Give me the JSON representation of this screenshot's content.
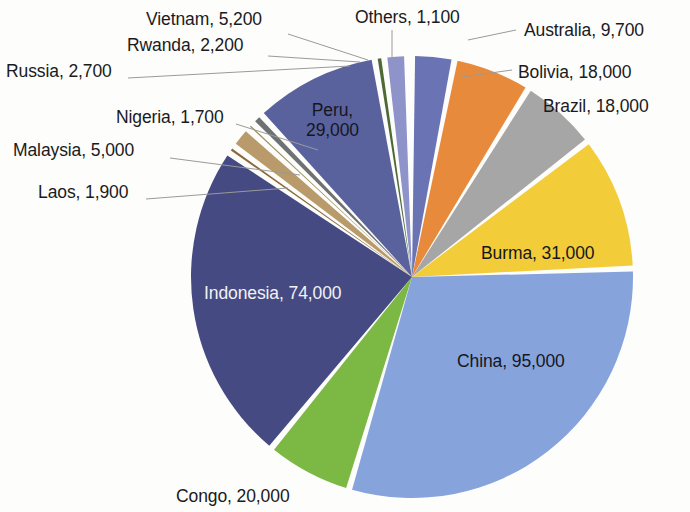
{
  "ghost_artifact": "scan-bleed",
  "chart_data": {
    "type": "pie",
    "title": "",
    "subtitle": "",
    "xlabel": "",
    "ylabel": "",
    "legend_position": "none",
    "grid": false,
    "label_format": "{name}, {value}",
    "total": 308500,
    "explode_gap_degrees": 1.6,
    "start_angle_degrees": 0,
    "direction": "clockwise",
    "categories": [
      "Australia",
      "Bolivia",
      "Brazil",
      "Burma",
      "China",
      "Congo",
      "Indonesia",
      "Laos",
      "Malaysia",
      "Nigeria",
      "Russia",
      "Rwanda",
      "Vietnam",
      "Others"
    ],
    "values": [
      9700,
      18000,
      18000,
      31000,
      95000,
      20000,
      74000,
      1900,
      5000,
      1700,
      2700,
      2200,
      5200,
      1100
    ],
    "colors": [
      "#6a73b4",
      "#e88a3c",
      "#a6a6a6",
      "#f2cc39",
      "#86a3db",
      "#7cb944",
      "#464a82",
      "#8a6a3c",
      "#b99a6a",
      "#9a8c5a",
      "#6e7272",
      "#4c6b33",
      "#8e93c9",
      "#e38b3e"
    ],
    "slices": [
      {
        "name": "Australia",
        "value": 9700,
        "label": "Australia, 9,700",
        "color": "#6a73b4",
        "label_placement": "outside-leader"
      },
      {
        "name": "Bolivia",
        "value": 18000,
        "label": "Bolivia, 18,000",
        "color": "#e88a3c",
        "label_placement": "outside-leader"
      },
      {
        "name": "Brazil",
        "value": 18000,
        "label": "Brazil, 18,000",
        "color": "#a6a6a6",
        "label_placement": "outside"
      },
      {
        "name": "Burma",
        "value": 31000,
        "label": "Burma, 31,000",
        "color": "#f2cc39",
        "label_placement": "inside"
      },
      {
        "name": "China",
        "value": 95000,
        "label": "China, 95,000",
        "color": "#86a3db",
        "label_placement": "inside"
      },
      {
        "name": "Congo",
        "value": 20000,
        "label": "Congo, 20,000",
        "color": "#7cb944",
        "label_placement": "outside"
      },
      {
        "name": "Indonesia",
        "value": 74000,
        "label": "Indonesia, 74,000",
        "color": "#464a82",
        "label_placement": "inside"
      },
      {
        "name": "Laos",
        "value": 1900,
        "label": "Laos, 1,900",
        "color": "#8a6a3c",
        "label_placement": "outside-leader"
      },
      {
        "name": "Malaysia",
        "value": 5000,
        "label": "Malaysia, 5,000",
        "color": "#b99a6a",
        "label_placement": "outside-leader"
      },
      {
        "name": "Nigeria",
        "value": 1700,
        "label": "Nigeria, 1,700",
        "color": "#9a8c5a",
        "label_placement": "outside-leader"
      },
      {
        "name": "Russia",
        "value": 2700,
        "label": "Russia, 2,700",
        "color": "#6e7272",
        "label_placement": "outside-leader"
      },
      {
        "name": "Rwanda",
        "value": 2200,
        "label": "Rwanda, 2,200",
        "color": "#4c6b33",
        "label_placement": "outside-leader"
      },
      {
        "name": "Vietnam",
        "value": 5200,
        "label": "Vietnam, 5,200",
        "color": "#8e93c9",
        "label_placement": "outside-leader"
      },
      {
        "name": "Others",
        "value": 1100,
        "label": "Others, 1,100",
        "color": "#e38b3e",
        "label_placement": "outside-leader"
      },
      {
        "name": "Peru",
        "value": 29000,
        "label": "Peru, 29,000",
        "color": "#5a629e",
        "label_placement": "inside"
      }
    ],
    "annotations": []
  },
  "labels": {
    "vietnam": "Vietnam, 5,200",
    "rwanda": "Rwanda, 2,200",
    "russia": "Russia, 2,700",
    "nigeria": "Nigeria, 1,700",
    "malaysia": "Malaysia, 5,000",
    "laos": "Laos, 1,900",
    "others": "Others, 1,100",
    "australia": "Australia, 9,700",
    "bolivia": "Bolivia, 18,000",
    "brazil": "Brazil, 18,000",
    "burma": "Burma, 31,000",
    "china": "China, 95,000",
    "congo": "Congo, 20,000",
    "indonesia": "Indonesia, 74,000",
    "peru_line1": "Peru,",
    "peru_line2": "29,000"
  }
}
